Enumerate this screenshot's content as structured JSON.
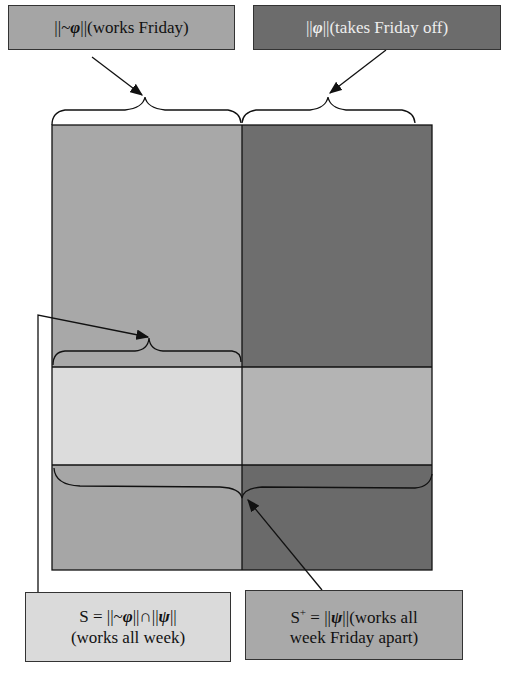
{
  "labels": {
    "top_left": {
      "pre": "||~",
      "sym": "φ",
      "post": "||(works Friday)"
    },
    "top_right": {
      "pre": "||",
      "sym": "φ",
      "post": "||(takes Friday off)"
    },
    "bottom_left": {
      "line1_pre": "S = ||~",
      "line1_sym1": "φ",
      "line1_mid": "||∩||",
      "line1_sym2": "ψ",
      "line1_post": "||",
      "line2": "(works all week)"
    },
    "bottom_right": {
      "line1_pre": "S",
      "line1_sup": "+",
      "line1_mid": " = ||",
      "line1_sym": "ψ",
      "line1_post": "||(works all",
      "line2": "week Friday apart)"
    }
  },
  "colors": {
    "left_top": "#a8a8a8",
    "right_top": "#6e6e6e",
    "left_mid": "#dcdcdc",
    "right_mid": "#b4b4b4",
    "left_bottom": "#a6a6a6",
    "right_bottom": "#6a6a6a",
    "box_top_left": "#a5a5a5",
    "box_top_right": "#6c6c6c",
    "box_bottom_left": "#dadada",
    "box_bottom_right": "#a9a9a9"
  }
}
